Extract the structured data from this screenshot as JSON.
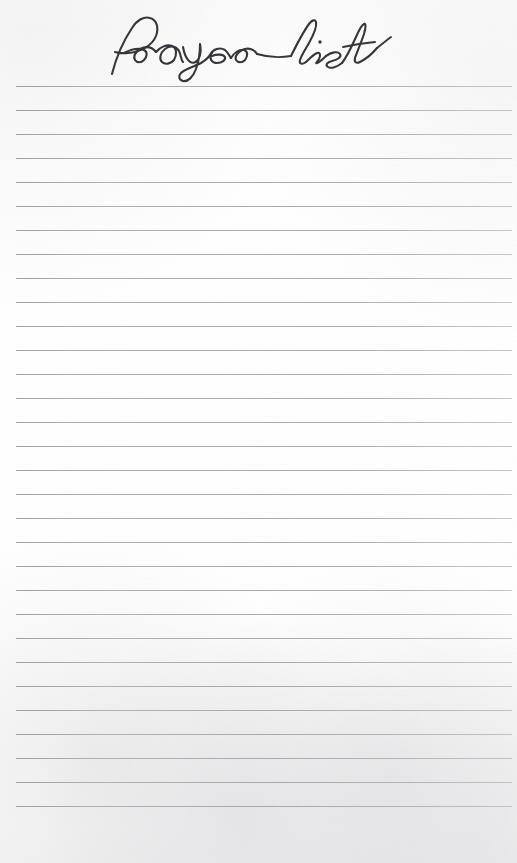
{
  "page": {
    "title": "Prayer list",
    "width": 517,
    "height": 863,
    "paper_color": "#fdfdfd",
    "type": "lined-notepad-page"
  },
  "heading": {
    "text": "Prayer list",
    "style": "handwritten-script",
    "color": "#37373b",
    "align": "center"
  },
  "ruled_lines": {
    "count": 31,
    "color": "#a0a0a5",
    "thickness_px": 1,
    "left_x": 16,
    "right_x": 512,
    "first_y": 86,
    "spacing_y": 24,
    "content": [
      "",
      "",
      "",
      "",
      "",
      "",
      "",
      "",
      "",
      "",
      "",
      "",
      "",
      "",
      "",
      "",
      "",
      "",
      "",
      "",
      "",
      "",
      "",
      "",
      "",
      "",
      "",
      "",
      "",
      "",
      ""
    ]
  },
  "footer": {
    "note": ""
  }
}
